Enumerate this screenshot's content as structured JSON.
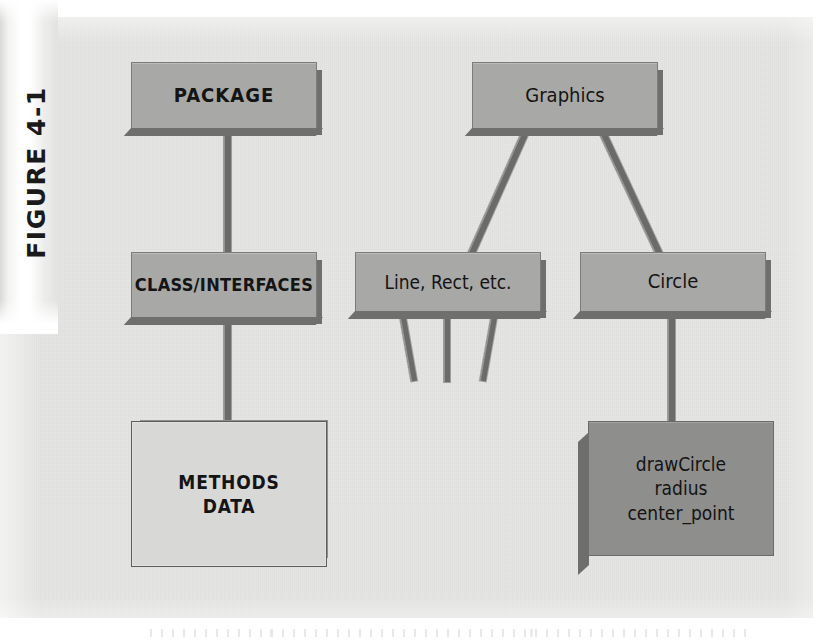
{
  "figure": {
    "label": "FIGURE 4-1",
    "caption": ""
  },
  "colors": {
    "panel_background": "#e6e6e4",
    "slab_fill": "#a8a8a6",
    "slab_shadow": "#6f6f6d",
    "light_box_fill": "#d8d8d6",
    "dark_box_fill": "#8e8e8c",
    "connector": "#6b6b69",
    "text": "#141414",
    "gutter": "#ffffff"
  },
  "diagram": {
    "type": "hierarchy",
    "nodes": [
      {
        "id": "package",
        "label": "PACKAGE",
        "style": "slab",
        "column": "left",
        "level": 1
      },
      {
        "id": "class",
        "label": "CLASS/INTERFACES",
        "style": "slab",
        "column": "left",
        "level": 2
      },
      {
        "id": "methods",
        "label": "METHODS\nDATA",
        "style": "light",
        "column": "left",
        "level": 3,
        "lines": [
          "METHODS",
          "DATA"
        ]
      },
      {
        "id": "graphics",
        "label": "Graphics",
        "style": "slab",
        "column": "right",
        "level": 1
      },
      {
        "id": "linerect",
        "label": "Line, Rect, etc.",
        "style": "slab",
        "column": "right",
        "level": 2
      },
      {
        "id": "circle",
        "label": "Circle",
        "style": "slab",
        "column": "right",
        "level": 2
      },
      {
        "id": "drawcircle",
        "label": "drawCircle\nradius\ncenter_point",
        "style": "dark",
        "column": "right",
        "level": 3,
        "lines": [
          "drawCircle",
          "radius",
          "center_point"
        ]
      }
    ],
    "edges": [
      {
        "from": "package",
        "to": "class",
        "kind": "vertical"
      },
      {
        "from": "class",
        "to": "methods",
        "kind": "vertical"
      },
      {
        "from": "graphics",
        "to": "linerect",
        "kind": "diagonal"
      },
      {
        "from": "graphics",
        "to": "circle",
        "kind": "diagonal"
      },
      {
        "from": "circle",
        "to": "drawcircle",
        "kind": "vertical"
      },
      {
        "from": "linerect",
        "to": "",
        "kind": "stub-left"
      },
      {
        "from": "linerect",
        "to": "",
        "kind": "stub-center"
      },
      {
        "from": "linerect",
        "to": "",
        "kind": "stub-right"
      }
    ]
  }
}
